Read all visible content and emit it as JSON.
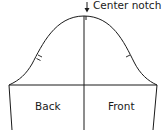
{
  "diagram": {
    "labels": {
      "center_notch": "Center notch",
      "back": "Back",
      "front": "Front"
    },
    "colors": {
      "line": "#1a1a1a",
      "background": "#ffffff"
    }
  }
}
